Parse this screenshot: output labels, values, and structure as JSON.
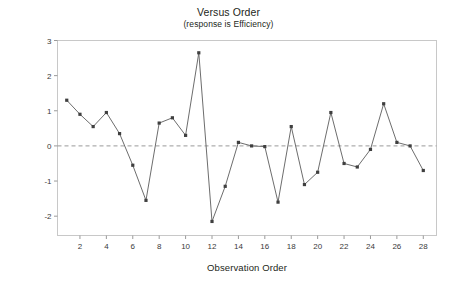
{
  "chart_data": {
    "type": "line",
    "title": "Versus Order",
    "subtitle": "(response is Efficiency)",
    "xlabel": "Observation Order",
    "ylabel": "Standardized Residual",
    "x": [
      1,
      2,
      3,
      4,
      5,
      6,
      7,
      8,
      9,
      10,
      11,
      12,
      13,
      14,
      15,
      16,
      17,
      18,
      19,
      20,
      21,
      22,
      23,
      24,
      25,
      26,
      27,
      28
    ],
    "values": [
      1.3,
      0.9,
      0.55,
      0.95,
      0.35,
      -0.55,
      -1.55,
      0.65,
      0.8,
      0.3,
      2.65,
      -2.15,
      -1.15,
      0.1,
      0.0,
      -0.02,
      -1.6,
      0.55,
      -1.1,
      -0.75,
      0.95,
      -0.5,
      -0.6,
      -0.1,
      1.2,
      0.1,
      0.0,
      -0.7
    ],
    "series": [
      {
        "name": "Standardized Residual",
        "values": [
          1.3,
          0.9,
          0.55,
          0.95,
          0.35,
          -0.55,
          -1.55,
          0.65,
          0.8,
          0.3,
          2.65,
          -2.15,
          -1.15,
          0.1,
          0.0,
          -0.02,
          -1.6,
          0.55,
          -1.1,
          -0.75,
          0.95,
          -0.5,
          -0.6,
          -0.1,
          1.2,
          0.1,
          0.0,
          -0.7
        ]
      }
    ],
    "xlim": [
      0.3,
      29.0
    ],
    "ylim": [
      -2.55,
      3.0
    ],
    "xticks": [
      2,
      4,
      6,
      8,
      10,
      12,
      14,
      16,
      18,
      20,
      22,
      24,
      26,
      28
    ],
    "xtick_labels": [
      "2",
      "4",
      "6",
      "8",
      "10",
      "12",
      "14",
      "16",
      "18",
      "20",
      "22",
      "24",
      "26",
      "28"
    ],
    "yticks": [
      -2,
      -1,
      0,
      1,
      2,
      3
    ],
    "ytick_labels": [
      "-2",
      "-1",
      "0",
      "1",
      "2",
      "3"
    ],
    "reference_line": {
      "y": 0,
      "style": "dashed",
      "color": "#9a9a9a"
    },
    "grid": false,
    "legend": "none",
    "marker": "square",
    "marker_color": "#3f3f3f",
    "line_color": "#6d6d6d",
    "frame_color": "#c8c8c8"
  }
}
